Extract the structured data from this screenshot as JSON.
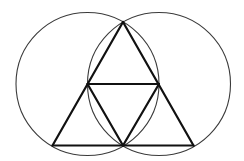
{
  "diagram": {
    "colors": {
      "background": "#ffffff",
      "circle_stroke": "#3a3a3a",
      "triangle_stroke": "#111111"
    },
    "circles": [
      {
        "name": "left-circle",
        "cx": 87.5,
        "cy": 84,
        "r": 71.5
      },
      {
        "name": "right-circle",
        "cx": 159,
        "cy": 84,
        "r": 71.5
      }
    ],
    "vertices": {
      "apex": [
        123,
        22
      ],
      "mid_left": [
        87.5,
        84
      ],
      "mid_right": [
        159,
        84
      ],
      "bottom_left": [
        52.5,
        145.5
      ],
      "bottom_center": [
        123,
        145.5
      ],
      "bottom_right": [
        193.5,
        145.5
      ]
    },
    "segments": [
      [
        "apex",
        "bottom_left"
      ],
      [
        "apex",
        "bottom_right"
      ],
      [
        "bottom_left",
        "bottom_right"
      ],
      [
        "mid_left",
        "mid_right"
      ],
      [
        "mid_left",
        "bottom_center"
      ],
      [
        "mid_right",
        "bottom_center"
      ]
    ]
  }
}
